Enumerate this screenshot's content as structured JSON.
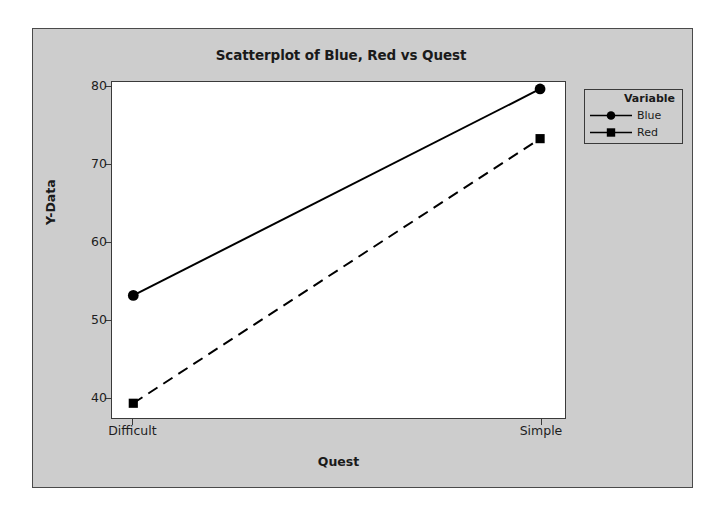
{
  "chart_data": {
    "type": "line",
    "title": "Scatterplot of Blue, Red vs Quest",
    "xlabel": "Quest",
    "ylabel": "Y-Data",
    "categories": [
      "Difficult",
      "Simple"
    ],
    "xtick_labels": [
      "Difficult",
      "Simple"
    ],
    "ytick_labels": [
      "40",
      "50",
      "60",
      "70",
      "80"
    ],
    "yticks": [
      40,
      50,
      60,
      70,
      80
    ],
    "ylim": [
      37.3,
      80.6
    ],
    "grid": false,
    "legend_position": "right",
    "legend_title": "Variable",
    "series": [
      {
        "name": "Blue",
        "values": [
          53.1,
          79.7
        ],
        "marker": "circle",
        "linestyle": "solid",
        "color": "#000000"
      },
      {
        "name": "Red",
        "values": [
          39.2,
          73.3
        ],
        "marker": "square",
        "linestyle": "dashed",
        "color": "#000000"
      }
    ]
  },
  "panel": {
    "background_color": "#cdcdcd",
    "plot_background_color": "#ffffff",
    "border_color": "#3a3a3a"
  },
  "legend": {
    "title": "Variable",
    "entries": [
      {
        "label": "Blue",
        "marker": "circle-marker",
        "linestyle": "solid"
      },
      {
        "label": "Red",
        "marker": "square-marker",
        "linestyle": "dashed"
      }
    ]
  }
}
